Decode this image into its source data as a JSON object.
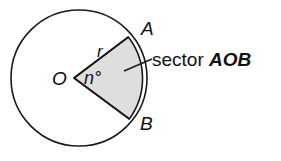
{
  "figure": {
    "type": "geometry-diagram",
    "background_color": "#ffffff",
    "stroke_color": "#1a1a1a",
    "sector_fill_color": "#dededc",
    "circle": {
      "center_label": "O",
      "center_x": 79,
      "center_y": 78,
      "radius": 68
    },
    "sector": {
      "vertex_x": 74,
      "vertex_y": 78,
      "point_a_label": "A",
      "point_b_label": "B",
      "angle_label": "n°",
      "radius_label": "r",
      "start_angle_deg": -37,
      "end_angle_deg": 36
    },
    "callout": {
      "text_plain": "sector ",
      "text_emphasis": "AOB",
      "full_text": "sector AOB",
      "leader_from_x": 124,
      "leader_from_y": 71,
      "leader_to_x": 152,
      "leader_to_y": 59
    },
    "labels": {
      "center": {
        "text": "O",
        "x": 53,
        "y": 85
      },
      "point_a": {
        "text": "A",
        "x": 141,
        "y": 35
      },
      "point_b": {
        "text": "B",
        "x": 140,
        "y": 130
      },
      "angle": {
        "text": "n°",
        "x": 84,
        "y": 84
      },
      "radius": {
        "text": "r",
        "x": 98,
        "y": 57
      }
    }
  }
}
